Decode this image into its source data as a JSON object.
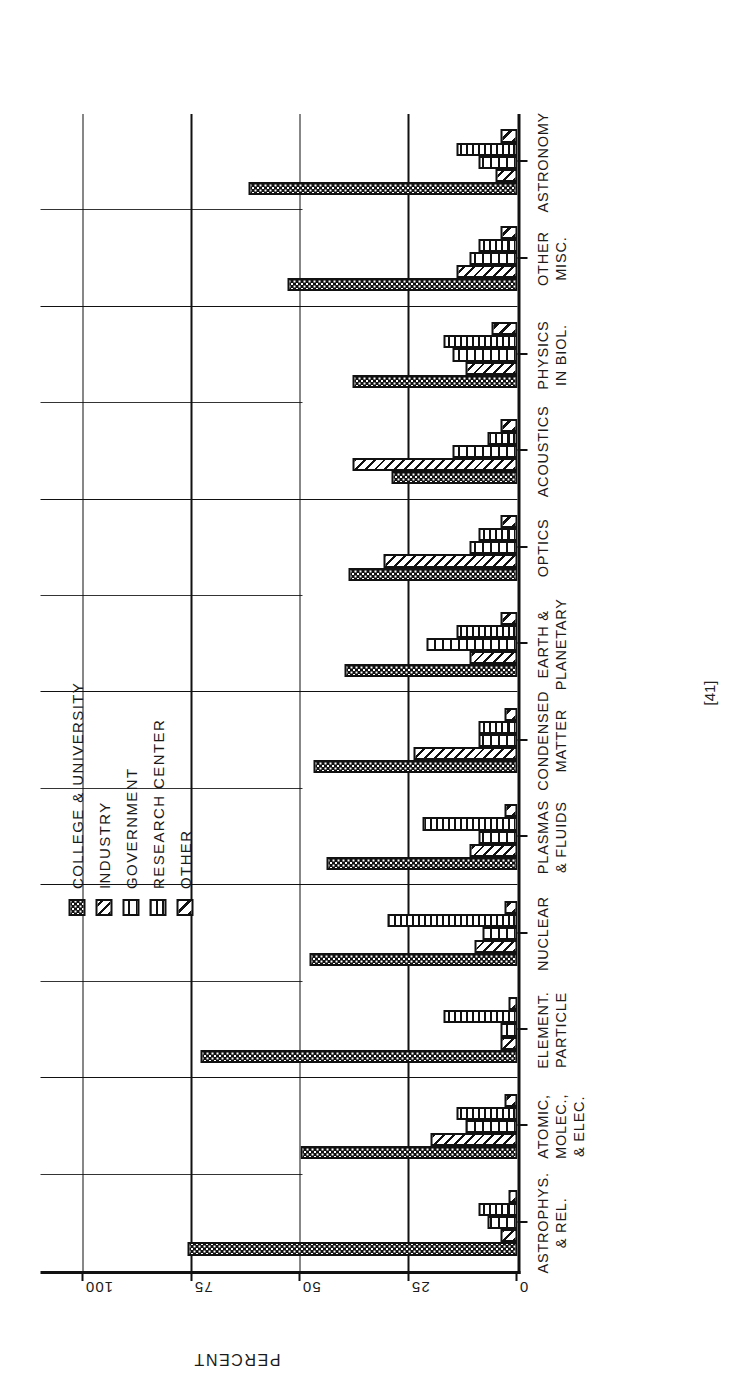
{
  "figure": {
    "page_number": "[41]",
    "axis": {
      "y_title": "PERCENT",
      "ticks": [
        "0",
        "25",
        "50",
        "75",
        "100"
      ],
      "tick_values": [
        0,
        25,
        50,
        75,
        100
      ]
    },
    "legend": {
      "items": [
        {
          "label": "COLLEGE & UNIVERSITY",
          "pattern": "dots",
          "icon": "swatch-dots-icon"
        },
        {
          "label": "INDUSTRY",
          "pattern": "diagonal",
          "icon": "swatch-diagonal-icon"
        },
        {
          "label": "GOVERNMENT",
          "pattern": "vertical",
          "icon": "swatch-vertical-icon"
        },
        {
          "label": "RESEARCH CENTER",
          "pattern": "vertical-wide",
          "icon": "swatch-vertical-wide-icon"
        },
        {
          "label": "OTHER",
          "pattern": "diagonal-wide",
          "icon": "swatch-diagonal-wide-icon"
        }
      ]
    }
  },
  "chart_data": {
    "type": "bar",
    "orientation": "grouped-vertical",
    "xlabel": "",
    "ylabel": "PERCENT",
    "ylim": [
      0,
      110
    ],
    "grid": true,
    "legend_position": "top-center",
    "categories": [
      "ASTROPHYS.\n& REL.",
      "ATOMIC,\nMOLEC.,\n& ELEC.",
      "ELEMENT.\nPARTICLE",
      "NUCLEAR",
      "PLASMAS\n& FLUIDS",
      "CONDENSED\nMATTER",
      "EARTH &\nPLANETARY",
      "OPTICS",
      "ACOUSTICS",
      "PHYSICS\nIN BIOL.",
      "OTHER\nMISC.",
      "ASTRONOMY"
    ],
    "series": [
      {
        "name": "COLLEGE & UNIVERSITY",
        "pattern": "dots",
        "values": [
          76,
          50,
          73,
          48,
          44,
          47,
          40,
          39,
          29,
          38,
          53,
          62
        ]
      },
      {
        "name": "INDUSTRY",
        "pattern": "diagonal",
        "values": [
          4,
          20,
          4,
          10,
          11,
          24,
          11,
          31,
          38,
          12,
          14,
          5
        ]
      },
      {
        "name": "GOVERNMENT",
        "pattern": "vertical",
        "values": [
          7,
          12,
          4,
          8,
          9,
          9,
          21,
          11,
          15,
          15,
          11,
          9
        ]
      },
      {
        "name": "RESEARCH CENTER",
        "pattern": "vertical-wide",
        "values": [
          9,
          14,
          17,
          30,
          22,
          9,
          14,
          9,
          7,
          17,
          9,
          14
        ]
      },
      {
        "name": "OTHER",
        "pattern": "diagonal-wide",
        "values": [
          2,
          3,
          2,
          3,
          3,
          3,
          4,
          4,
          4,
          6,
          4,
          4
        ]
      }
    ]
  }
}
